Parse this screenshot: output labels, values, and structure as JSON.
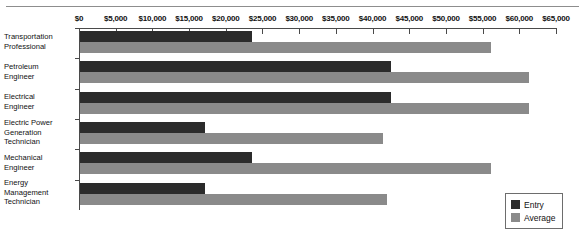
{
  "chart_data": {
    "type": "bar",
    "orientation": "horizontal",
    "title": "",
    "xlabel": "",
    "ylabel": "",
    "xlim": [
      0,
      65000
    ],
    "grid": false,
    "legend_position": "bottom-right",
    "tick_labels": [
      "$0",
      "$5,000",
      "$10,000",
      "$15,000",
      "$20,000",
      "$25,000",
      "$30,000",
      "$35,000",
      "$40,000",
      "$45,000",
      "$50,000",
      "$55,000",
      "$60,000",
      "$65,000"
    ],
    "tick_values": [
      0,
      5000,
      10000,
      15000,
      20000,
      25000,
      30000,
      35000,
      40000,
      45000,
      50000,
      55000,
      60000,
      65000
    ],
    "categories": [
      "Transportation\nProfessional",
      "Petroleum\nEngineer",
      "Electrical\nEngineer",
      "Electric Power\nGeneration\nTechnician",
      "Mechanical\nEngineer",
      "Energy\nManagement\nTechnician"
    ],
    "series": [
      {
        "name": "Entry",
        "color": "#2b2b2b",
        "values": [
          23500,
          42400,
          42400,
          17000,
          23500,
          17000
        ]
      },
      {
        "name": "Average",
        "color": "#8a8a8a",
        "values": [
          56000,
          61200,
          61200,
          41300,
          56000,
          41800
        ]
      }
    ]
  },
  "legend": {
    "items": [
      {
        "label": "Entry",
        "color": "#2b2b2b"
      },
      {
        "label": "Average",
        "color": "#8a8a8a"
      }
    ]
  }
}
